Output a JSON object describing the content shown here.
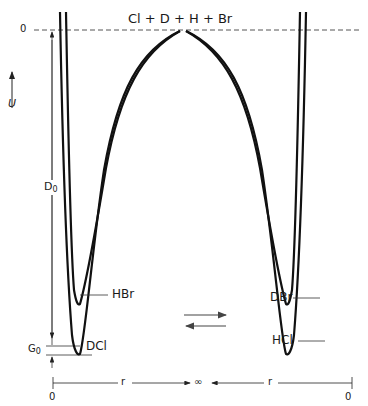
{
  "diagram": {
    "type": "potential-energy-curves",
    "title_label": "Cl + D + H + Br",
    "zero_label": "0",
    "energy_axis_label": "U",
    "d0_label": "D",
    "d0_sub": "0",
    "g0_label": "G",
    "g0_sub": "0",
    "curves": [
      {
        "name": "HBr",
        "side": "left",
        "well": "shallow"
      },
      {
        "name": "DCl",
        "side": "left",
        "well": "deep"
      },
      {
        "name": "DBr",
        "side": "right",
        "well": "shallow"
      },
      {
        "name": "HCl",
        "side": "right",
        "well": "deep"
      }
    ],
    "labels": {
      "hbr": "HBr",
      "dcl": "DCl",
      "dbr": "DBr",
      "hcl": "HCl"
    },
    "reaction_arrows": "equilibrium (⇄)",
    "bottom_axis": {
      "left_zero": "0",
      "left_r": "r",
      "infinity": "∞",
      "right_r": "r",
      "right_zero": "0"
    },
    "colors": {
      "line": "#111111",
      "dashed": "#555555",
      "arrow": "#444444"
    }
  }
}
